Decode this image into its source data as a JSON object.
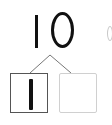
{
  "diagram": {
    "type": "number-bond",
    "whole": "10",
    "parts": [
      {
        "value": "1",
        "state": "filled"
      },
      {
        "value": "",
        "state": "empty"
      }
    ],
    "partial_edge_glyph": "("
  },
  "colors": {
    "text": "#111111",
    "left_box_border": "#555555",
    "right_box_border": "#d0d0d0",
    "connector": "#777777"
  }
}
